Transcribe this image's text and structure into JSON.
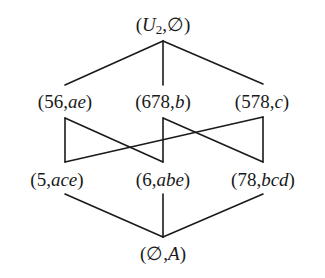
{
  "diagram": {
    "type": "concept-lattice",
    "nodes": [
      {
        "id": "top",
        "label": "(U2,∅)",
        "parts": [
          "(",
          "U",
          "2",
          ",∅)"
        ],
        "x": 163,
        "y": 31
      },
      {
        "id": "n56ae",
        "label": "(56,ae)",
        "extent": "56",
        "intent": "ae",
        "x": 65,
        "y": 108
      },
      {
        "id": "n678b",
        "label": "(678,b)",
        "extent": "678",
        "intent": "b",
        "x": 163,
        "y": 108
      },
      {
        "id": "n578c",
        "label": "(578,c)",
        "extent": "578",
        "intent": "c",
        "x": 262,
        "y": 108
      },
      {
        "id": "n5ace",
        "label": "(5,ace)",
        "extent": "5",
        "intent": "ace",
        "x": 57,
        "y": 186
      },
      {
        "id": "n6abe",
        "label": "(6,abe)",
        "extent": "6",
        "intent": "abe",
        "x": 163,
        "y": 186
      },
      {
        "id": "n78bcd",
        "label": "(78,bcd)",
        "extent": "78",
        "intent": "bcd",
        "x": 263,
        "y": 186
      },
      {
        "id": "bottom",
        "label": "(∅,A)",
        "extent": "∅",
        "intent": "A",
        "x": 163,
        "y": 260
      }
    ],
    "edges": [
      {
        "from": "top",
        "to": "n56ae"
      },
      {
        "from": "top",
        "to": "n678b"
      },
      {
        "from": "top",
        "to": "n578c"
      },
      {
        "from": "n56ae",
        "to": "n5ace"
      },
      {
        "from": "n56ae",
        "to": "n6abe"
      },
      {
        "from": "n678b",
        "to": "n6abe"
      },
      {
        "from": "n678b",
        "to": "n78bcd"
      },
      {
        "from": "n578c",
        "to": "n78bcd"
      },
      {
        "from": "n578c",
        "to": "n5ace"
      },
      {
        "from": "n5ace",
        "to": "bottom"
      },
      {
        "from": "n6abe",
        "to": "bottom"
      },
      {
        "from": "n78bcd",
        "to": "bottom"
      }
    ],
    "text": {
      "top_open": "(",
      "top_U": "U",
      "top_sub": "2",
      "top_rest": ",∅)",
      "n56ae_extent": "(56,",
      "n56ae_intent": "ae",
      "n678b_extent": "(678,",
      "n678b_intent": "b",
      "n578c_extent": "(578,",
      "n578c_intent": "c",
      "n5ace_extent": "(5,",
      "n5ace_intent": "ace",
      "n6abe_extent": "(6,",
      "n6abe_intent": "abe",
      "n78bcd_extent": "(78,",
      "n78bcd_intent": "bcd",
      "bottom_open": "(∅,",
      "bottom_A": "A",
      "close": ")"
    }
  }
}
